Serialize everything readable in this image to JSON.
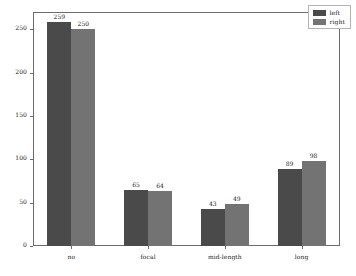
{
  "chart_data": {
    "type": "bar",
    "title": "",
    "xlabel": "",
    "ylabel": "",
    "categories": [
      "no",
      "focal",
      "mid-length",
      "long"
    ],
    "series": [
      {
        "name": "left",
        "color": "#4a4a4a",
        "values": [
          259,
          65,
          43,
          89
        ]
      },
      {
        "name": "right",
        "color": "#737373",
        "values": [
          250,
          64,
          49,
          98
        ]
      }
    ],
    "ylim": [
      0,
      270
    ],
    "yticks": [
      0,
      50,
      100,
      150,
      200,
      250
    ],
    "ytick_labels": [
      "0",
      "50",
      "100",
      "150",
      "200",
      "250"
    ],
    "grid": false,
    "legend_position": "upper right",
    "value_labels_shown": true,
    "frame": true
  },
  "legend": {
    "entries": [
      {
        "label": "left"
      },
      {
        "label": "right"
      }
    ]
  }
}
